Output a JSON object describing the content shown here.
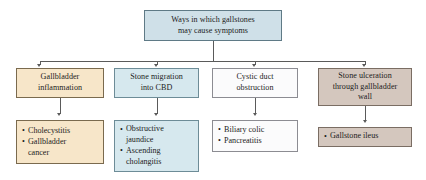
{
  "diagram": {
    "title_box": {
      "name": "root",
      "lines": [
        "Ways in which gallstones",
        "may cause symptoms"
      ],
      "color": "#cfe0e8"
    },
    "branches": [
      {
        "id": "gallbladder-inflammation",
        "cause": {
          "lines": [
            "Gallbladder",
            "inflammation"
          ],
          "color": "#f7e6c9"
        },
        "outcomes": {
          "color": "#f7e6c9",
          "items": [
            {
              "lines": [
                "Cholecystitis"
              ]
            },
            {
              "lines": [
                "Gallbladder",
                "cancer"
              ]
            }
          ]
        }
      },
      {
        "id": "stone-migration-cbd",
        "cause": {
          "lines": [
            "Stone migration",
            "into CBD"
          ],
          "color": "#d6e8ee"
        },
        "outcomes": {
          "color": "#d6e8ee",
          "items": [
            {
              "lines": [
                "Obstructive",
                "jaundice"
              ]
            },
            {
              "lines": [
                "Ascending",
                "cholangitis"
              ]
            }
          ]
        }
      },
      {
        "id": "cystic-duct-obstruction",
        "cause": {
          "lines": [
            "Cystic duct",
            "obstruction"
          ],
          "color": "#fbfbfc"
        },
        "outcomes": {
          "color": "#fbfbfc",
          "items": [
            {
              "lines": [
                "Biliary colic"
              ]
            },
            {
              "lines": [
                "Pancreatitis"
              ]
            }
          ]
        }
      },
      {
        "id": "stone-ulceration",
        "cause": {
          "lines": [
            "Stone ulceration",
            "through gallbladder",
            "wall"
          ],
          "color": "#d4c7be"
        },
        "outcomes": {
          "color": "#d4c7be",
          "items": [
            {
              "lines": [
                "Gallstone ileus"
              ]
            }
          ]
        }
      }
    ],
    "bullet_glyph": "•",
    "line_color": "#5a5a5a"
  }
}
